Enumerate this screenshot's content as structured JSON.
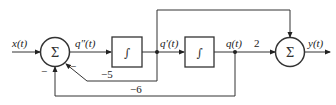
{
  "diagram": {
    "type": "block-diagram",
    "signals": {
      "input": "x(t)",
      "q_ddot": "q″(t)",
      "q_dot": "q′(t)",
      "q": "q(t)",
      "output": "y(t)"
    },
    "blocks": {
      "sum1": "Σ",
      "integrator1": "∫",
      "integrator2": "∫",
      "sum2": "Σ"
    },
    "gains": {
      "feedback_qdot": "−5",
      "feedback_q": "−6",
      "forward_q": "2"
    },
    "signs": {
      "sum1_fb_qdot": "−",
      "sum1_fb_q": "−"
    }
  }
}
